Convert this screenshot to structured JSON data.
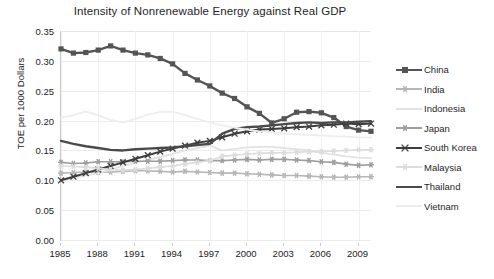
{
  "chart_data": {
    "type": "line",
    "title": "Intensity of Nonrenewable Energy against Real GDP",
    "xlabel": "",
    "ylabel": "TOE per 1000 Dollars",
    "grid": true,
    "legend_position": "right",
    "ylim": [
      0.0,
      0.35
    ],
    "yticks": [
      "0.00",
      "0.05",
      "0.10",
      "0.15",
      "0.20",
      "0.25",
      "0.30",
      "0.35"
    ],
    "ytick_values": [
      0.0,
      0.05,
      0.1,
      0.15,
      0.2,
      0.25,
      0.3,
      0.35
    ],
    "xlim": [
      1985,
      2010
    ],
    "xticks": [
      "1985",
      "1988",
      "1991",
      "1994",
      "1997",
      "2000",
      "2003",
      "2006",
      "2009"
    ],
    "xtick_values": [
      1985,
      1988,
      1991,
      1994,
      1997,
      2000,
      2003,
      2006,
      2009
    ],
    "x": [
      1985,
      1986,
      1987,
      1988,
      1989,
      1990,
      1991,
      1992,
      1993,
      1994,
      1995,
      1996,
      1997,
      1998,
      1999,
      2000,
      2001,
      2002,
      2003,
      2004,
      2005,
      2006,
      2007,
      2008,
      2009,
      2010
    ],
    "series": [
      {
        "name": "China",
        "color": "#545454",
        "marker": "square",
        "width": 2.4,
        "values": [
          0.32,
          0.313,
          0.314,
          0.318,
          0.325,
          0.318,
          0.313,
          0.31,
          0.304,
          0.295,
          0.279,
          0.268,
          0.258,
          0.246,
          0.237,
          0.223,
          0.212,
          0.196,
          0.203,
          0.214,
          0.215,
          0.213,
          0.205,
          0.19,
          0.184,
          0.182
        ]
      },
      {
        "name": "India",
        "color": "#b6b6b6",
        "marker": "star",
        "width": 1.6,
        "values": [
          0.112,
          0.113,
          0.114,
          0.113,
          0.114,
          0.115,
          0.116,
          0.116,
          0.115,
          0.114,
          0.115,
          0.114,
          0.113,
          0.112,
          0.112,
          0.111,
          0.11,
          0.109,
          0.108,
          0.108,
          0.107,
          0.106,
          0.105,
          0.105,
          0.106,
          0.106
        ]
      },
      {
        "name": "Indonesia",
        "color": "#e2e2e2",
        "marker": "none",
        "width": 1.8,
        "values": [
          0.1,
          0.104,
          0.108,
          0.112,
          0.118,
          0.124,
          0.129,
          0.134,
          0.139,
          0.144,
          0.15,
          0.154,
          0.158,
          0.15,
          0.152,
          0.155,
          0.156,
          0.156,
          0.154,
          0.152,
          0.15,
          0.146,
          0.143,
          0.14,
          0.138,
          0.137
        ]
      },
      {
        "name": "Japan",
        "color": "#9e9e9e",
        "marker": "star",
        "width": 1.6,
        "values": [
          0.13,
          0.128,
          0.129,
          0.131,
          0.131,
          0.131,
          0.132,
          0.132,
          0.132,
          0.133,
          0.134,
          0.134,
          0.133,
          0.133,
          0.134,
          0.135,
          0.134,
          0.135,
          0.135,
          0.134,
          0.133,
          0.131,
          0.13,
          0.127,
          0.125,
          0.126
        ]
      },
      {
        "name": "South Korea",
        "color": "#3d3d3d",
        "marker": "cross",
        "width": 2.0,
        "values": [
          0.1,
          0.106,
          0.112,
          0.118,
          0.124,
          0.13,
          0.136,
          0.142,
          0.148,
          0.153,
          0.158,
          0.163,
          0.166,
          0.172,
          0.178,
          0.182,
          0.185,
          0.186,
          0.187,
          0.189,
          0.19,
          0.192,
          0.193,
          0.195,
          0.194,
          0.195
        ]
      },
      {
        "name": "Malaysia",
        "color": "#dcdcdc",
        "marker": "star",
        "width": 1.6,
        "values": [
          0.124,
          0.123,
          0.122,
          0.12,
          0.118,
          0.117,
          0.118,
          0.12,
          0.122,
          0.124,
          0.127,
          0.13,
          0.133,
          0.14,
          0.142,
          0.144,
          0.145,
          0.146,
          0.146,
          0.147,
          0.148,
          0.148,
          0.149,
          0.15,
          0.151,
          0.151
        ]
      },
      {
        "name": "Thailand",
        "color": "#4a4a4a",
        "marker": "none",
        "width": 2.4,
        "values": [
          0.166,
          0.161,
          0.157,
          0.154,
          0.151,
          0.15,
          0.152,
          0.153,
          0.154,
          0.155,
          0.157,
          0.159,
          0.161,
          0.178,
          0.186,
          0.189,
          0.19,
          0.192,
          0.194,
          0.196,
          0.197,
          0.196,
          0.197,
          0.197,
          0.198,
          0.199
        ]
      },
      {
        "name": "Vietnam",
        "color": "#ededed",
        "marker": "none",
        "width": 1.8,
        "values": [
          0.205,
          0.209,
          0.215,
          0.209,
          0.201,
          0.197,
          0.203,
          0.21,
          0.214,
          0.215,
          0.209,
          0.203,
          0.197,
          0.192,
          0.188,
          0.185,
          0.182,
          0.18,
          0.178,
          0.177,
          0.176,
          0.175,
          0.174,
          0.173,
          0.172,
          0.172
        ]
      }
    ]
  },
  "legend": {
    "items": [
      {
        "label": "China"
      },
      {
        "label": "India"
      },
      {
        "label": "Indonesia"
      },
      {
        "label": "Japan"
      },
      {
        "label": "South Korea"
      },
      {
        "label": "Malaysia"
      },
      {
        "label": "Thailand"
      },
      {
        "label": "Vietnam"
      }
    ]
  }
}
